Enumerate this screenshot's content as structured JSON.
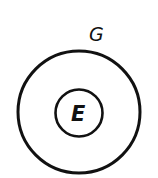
{
  "diagram": {
    "type": "nested-sets",
    "stroke_color": "#111111",
    "outer_set": {
      "label": "G",
      "cx": 79,
      "cy": 112,
      "r": 62
    },
    "inner_set": {
      "label": "E",
      "cx": 79,
      "cy": 113,
      "r": 24
    }
  }
}
